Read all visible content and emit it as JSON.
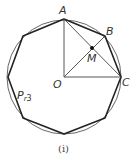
{
  "figure": {
    "caption": "(i)",
    "labels": {
      "A": "A",
      "B": "B",
      "C": "C",
      "O": "O",
      "M": "M",
      "polygon_sub_main": "P",
      "polygon_sub_r": "r",
      "polygon_sub_n": "3"
    },
    "colors": {
      "stroke": "#333333",
      "circle": "#555555",
      "background": "#ffffff"
    }
  }
}
